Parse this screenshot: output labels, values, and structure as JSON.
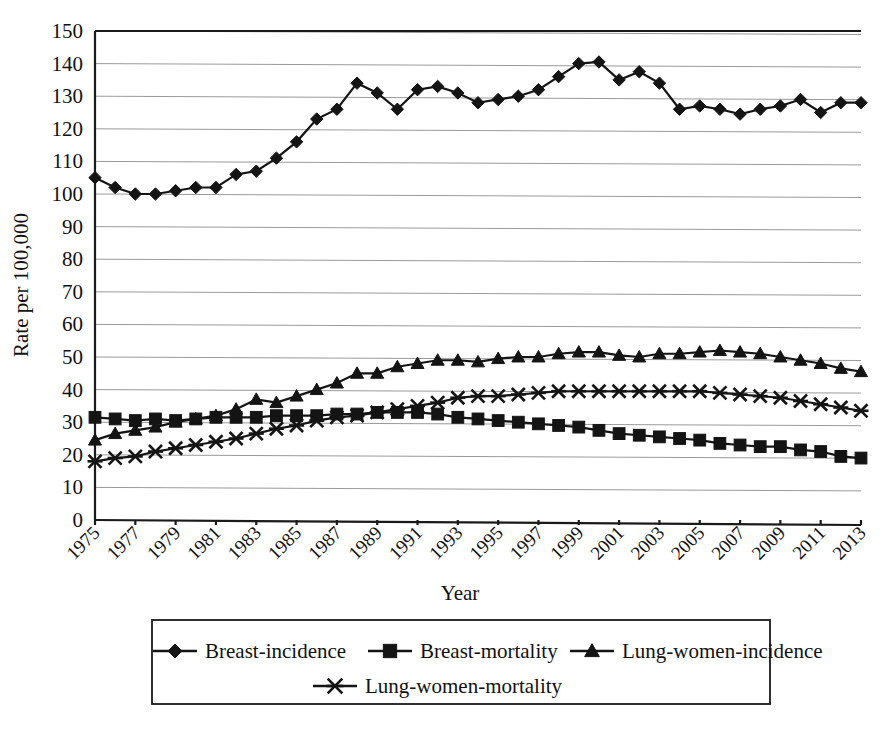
{
  "chart_data": {
    "type": "line",
    "title": "",
    "xlabel": "Year",
    "ylabel": "Rate per 100,000",
    "ylim": [
      0,
      150
    ],
    "ytick_step": 10,
    "yticks": [
      0,
      10,
      20,
      30,
      40,
      50,
      60,
      70,
      80,
      90,
      100,
      110,
      120,
      130,
      140,
      150
    ],
    "xlim": [
      1975,
      2013
    ],
    "xticks": [
      1975,
      1977,
      1979,
      1981,
      1983,
      1985,
      1987,
      1989,
      1991,
      1993,
      1995,
      1997,
      1999,
      2001,
      2003,
      2005,
      2007,
      2009,
      2011,
      2013
    ],
    "x": [
      1975,
      1976,
      1977,
      1978,
      1979,
      1980,
      1981,
      1982,
      1983,
      1984,
      1985,
      1986,
      1987,
      1988,
      1989,
      1990,
      1991,
      1992,
      1993,
      1994,
      1995,
      1996,
      1997,
      1998,
      1999,
      2000,
      2001,
      2002,
      2003,
      2004,
      2005,
      2006,
      2007,
      2008,
      2009,
      2010,
      2011,
      2012,
      2013
    ],
    "grid": true,
    "legend_position": "bottom",
    "series": [
      {
        "name": "Breast-incidence",
        "marker": "diamond",
        "color": "#141414",
        "values": [
          105,
          102,
          100,
          100,
          101,
          102,
          102,
          106,
          107,
          111,
          116,
          123,
          126,
          134,
          131,
          126,
          132,
          133,
          131,
          128,
          129,
          130,
          132,
          136,
          140,
          140.5,
          135,
          137.5,
          134,
          126,
          127,
          126,
          124.5,
          126,
          127,
          129,
          125,
          128,
          128
        ]
      },
      {
        "name": "Breast-mortality",
        "marker": "square",
        "color": "#141414",
        "values": [
          31.5,
          31,
          30.5,
          31,
          30.5,
          31,
          31.5,
          31.5,
          31.5,
          32,
          32,
          32,
          32.5,
          32.5,
          33,
          33,
          33,
          32.5,
          31.5,
          31,
          30.5,
          30,
          29.5,
          29,
          28.5,
          27.5,
          26.5,
          26,
          25.5,
          25,
          24.5,
          23.5,
          23,
          22.5,
          22.5,
          21.5,
          21,
          19.5,
          19
        ]
      },
      {
        "name": "Lung-women-incidence",
        "marker": "triangle",
        "color": "#141414",
        "values": [
          24.5,
          26.5,
          27.5,
          28.5,
          30,
          31,
          32,
          34,
          37,
          36,
          38,
          40,
          42,
          45,
          45,
          47,
          48,
          49,
          49,
          48.5,
          49.5,
          50,
          50,
          51,
          51.5,
          51.5,
          50.5,
          50,
          51,
          51,
          51.5,
          52,
          51.5,
          51,
          50,
          49,
          48,
          46.5,
          45.5
        ]
      },
      {
        "name": "Lung-women-mortality",
        "marker": "cross",
        "color": "#141414",
        "values": [
          18,
          19,
          19.5,
          21,
          22,
          23,
          24,
          25,
          26.5,
          28,
          29,
          30.5,
          31.5,
          32,
          33,
          34,
          35,
          36,
          37.5,
          38,
          38,
          38.5,
          39,
          39.5,
          39.5,
          39.5,
          39.5,
          39.5,
          39.5,
          39.5,
          39.5,
          39,
          38.5,
          38,
          37.5,
          36.5,
          35.5,
          34.5,
          33.5
        ]
      }
    ]
  },
  "axis": {
    "ylabel": "Rate per 100,000",
    "xlabel": "Year"
  },
  "legend": {
    "items": [
      {
        "label": "Breast-incidence",
        "marker": "diamond"
      },
      {
        "label": "Breast-mortality",
        "marker": "square"
      },
      {
        "label": "Lung-women-incidence",
        "marker": "triangle"
      },
      {
        "label": "Lung-women-mortality",
        "marker": "cross"
      }
    ]
  }
}
